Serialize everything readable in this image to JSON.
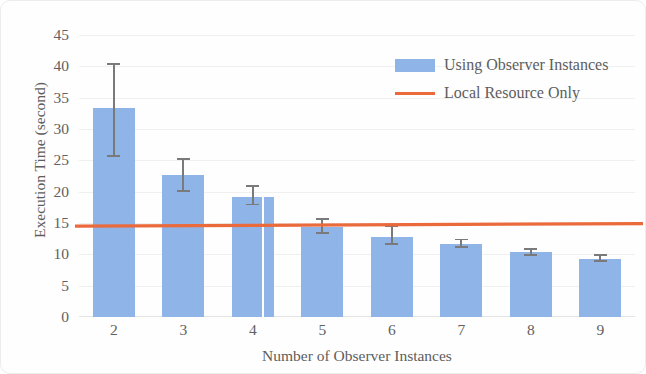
{
  "chart_data": {
    "type": "bar",
    "title": "",
    "xlabel": "Number of Observer Instances",
    "ylabel": "Execution Time (second)",
    "categories": [
      "2",
      "3",
      "4",
      "5",
      "6",
      "7",
      "8",
      "9"
    ],
    "ylim": [
      0,
      45
    ],
    "yticks": [
      "0",
      "5",
      "10",
      "15",
      "20",
      "25",
      "30",
      "35",
      "40",
      "45"
    ],
    "grid": true,
    "legend_position": "top-right",
    "series": [
      {
        "name": "Using Observer Instances",
        "type": "bar",
        "color": "#8fb4e8",
        "values": [
          33.3,
          22.7,
          19.1,
          14.4,
          12.8,
          11.7,
          10.3,
          9.3
        ],
        "error_low": [
          25.5,
          20.0,
          17.8,
          13.3,
          11.5,
          11.0,
          9.7,
          8.8
        ],
        "error_high": [
          40.5,
          25.3,
          21.0,
          15.8,
          14.6,
          12.5,
          11.0,
          10.1
        ]
      },
      {
        "name": "Local Resource Only",
        "type": "line",
        "color": "#ea6a3c",
        "value_left": 14.5,
        "value_right": 14.9
      }
    ]
  },
  "legend": {
    "items": [
      {
        "label": "Using Observer Instances",
        "marker": "bar-swatch",
        "color": "#8fb4e8"
      },
      {
        "label": "Local Resource Only",
        "marker": "line-swatch",
        "color": "#ea6a3c"
      }
    ]
  },
  "axes": {
    "y_title": "Execution Time (second)",
    "x_title": "Number of Observer Instances"
  }
}
